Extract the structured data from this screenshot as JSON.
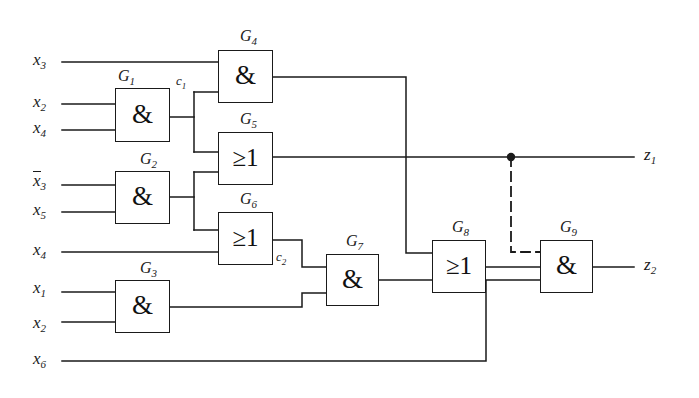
{
  "diagram": {
    "stroke_color": "#1a1a1a",
    "background": "#ffffff"
  },
  "inputs": [
    {
      "name": "x3",
      "base": "x",
      "sub": "3",
      "inverted": false,
      "y": 62
    },
    {
      "name": "x2",
      "base": "x",
      "sub": "2",
      "inverted": false,
      "y": 104
    },
    {
      "name": "x4",
      "base": "x",
      "sub": "4",
      "inverted": false,
      "y": 130
    },
    {
      "name": "x3n",
      "base": "x",
      "sub": "3",
      "inverted": true,
      "y": 173
    },
    {
      "name": "x5",
      "base": "x",
      "sub": "5",
      "inverted": false,
      "y": 212
    },
    {
      "name": "x4b",
      "base": "x",
      "sub": "4",
      "inverted": false,
      "y": 252
    },
    {
      "name": "x1",
      "base": "x",
      "sub": "1",
      "inverted": false,
      "y": 290
    },
    {
      "name": "x2b",
      "base": "x",
      "sub": "2",
      "inverted": false,
      "y": 325
    },
    {
      "name": "x6",
      "base": "x",
      "sub": "6",
      "inverted": false,
      "y": 361
    }
  ],
  "outputs": [
    {
      "name": "z1",
      "base": "z",
      "sub": "1",
      "y": 157
    },
    {
      "name": "z2",
      "base": "z",
      "sub": "2",
      "y": 267
    }
  ],
  "gates": [
    {
      "id": "G1",
      "label": "G",
      "sub": "1",
      "symbol": "&",
      "type": "and",
      "x": 115,
      "y": 88,
      "w": 55,
      "h": 54,
      "label_x": 126,
      "label_y": 70
    },
    {
      "id": "G2",
      "label": "G",
      "sub": "2",
      "symbol": "&",
      "type": "and",
      "x": 115,
      "y": 171,
      "w": 55,
      "h": 53,
      "label_x": 147,
      "label_y": 153
    },
    {
      "id": "G3",
      "label": "G",
      "sub": "3",
      "symbol": "&",
      "type": "and",
      "x": 115,
      "y": 280,
      "w": 55,
      "h": 53,
      "label_x": 147,
      "label_y": 262
    },
    {
      "id": "G4",
      "label": "G",
      "sub": "4",
      "symbol": "&",
      "type": "and",
      "x": 218,
      "y": 50,
      "w": 55,
      "h": 53,
      "label_x": 249,
      "label_y": 30
    },
    {
      "id": "G5",
      "label": "G",
      "sub": "5",
      "symbol": "≥1",
      "type": "or",
      "x": 218,
      "y": 132,
      "w": 55,
      "h": 53,
      "label_x": 249,
      "label_y": 113
    },
    {
      "id": "G6",
      "label": "G",
      "sub": "6",
      "symbol": "≥1",
      "type": "or",
      "x": 218,
      "y": 212,
      "w": 55,
      "h": 53,
      "label_x": 249,
      "label_y": 194
    },
    {
      "id": "G7",
      "label": "G",
      "sub": "7",
      "symbol": "&",
      "type": "and",
      "x": 326,
      "y": 254,
      "w": 53,
      "h": 52,
      "label_x": 355,
      "label_y": 236
    },
    {
      "id": "G8",
      "label": "G",
      "sub": "8",
      "symbol": "≥1",
      "type": "or",
      "x": 432,
      "y": 240,
      "w": 54,
      "h": 53,
      "label_x": 461,
      "label_y": 222
    },
    {
      "id": "G9",
      "label": "G",
      "sub": "9",
      "symbol": "&",
      "type": "and",
      "x": 540,
      "y": 240,
      "w": 53,
      "h": 53,
      "label_x": 569,
      "label_y": 222
    }
  ],
  "wire_labels": [
    {
      "name": "c1",
      "base": "c",
      "sub": "1",
      "x": 176,
      "y": 80
    },
    {
      "name": "c2",
      "base": "c",
      "sub": "2",
      "x": 277,
      "y": 256
    }
  ],
  "junctions": [
    {
      "name": "z1-tap",
      "x": 511,
      "y": 157,
      "r": 4
    }
  ],
  "dashed_wire": {
    "name": "z1-to-G9-feedback",
    "points": "511,157 511,252 540,252"
  },
  "netlist": {
    "G1": {
      "inputs": [
        "x2",
        "x4"
      ],
      "output": "c1"
    },
    "G2": {
      "inputs": [
        "x3n",
        "x5"
      ],
      "output": "G2out"
    },
    "G3": {
      "inputs": [
        "x1",
        "x2"
      ],
      "output": "G3out"
    },
    "G4": {
      "inputs": [
        "x3",
        "c1"
      ],
      "output": "G4out"
    },
    "G5": {
      "inputs": [
        "c1",
        "G2out"
      ],
      "output": "z1"
    },
    "G6": {
      "inputs": [
        "G2out",
        "x4"
      ],
      "output": "c2"
    },
    "G7": {
      "inputs": [
        "c2",
        "G3out"
      ],
      "output": "G7out"
    },
    "G8": {
      "inputs": [
        "G4out",
        "G7out"
      ],
      "output": "G8out"
    },
    "G9": {
      "inputs": [
        "G8out",
        "x6"
      ],
      "output": "z2"
    }
  }
}
